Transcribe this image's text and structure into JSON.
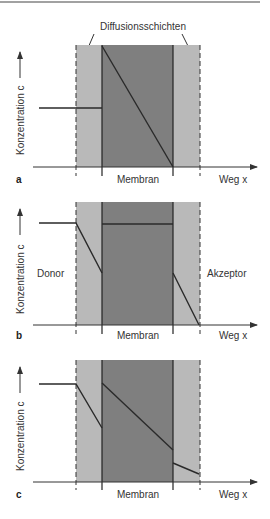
{
  "figure": {
    "top_label": "Diffusionsschichten",
    "colors": {
      "diffusion_layer": "#b9b9b9",
      "membrane": "#7f7f7f",
      "line": "#2a2a2a",
      "text": "#333333"
    },
    "panels": [
      {
        "letter": "a",
        "y_label": "Konzentration c",
        "x_label": "Weg x",
        "membrane_label": "Membran",
        "donor_label": "",
        "acceptor_label": ""
      },
      {
        "letter": "b",
        "y_label": "Konzentration c",
        "x_label": "Weg x",
        "membrane_label": "Membran",
        "donor_label": "Donor",
        "acceptor_label": "Akzeptor"
      },
      {
        "letter": "c",
        "y_label": "Konzentration c",
        "x_label": "Weg x",
        "membrane_label": "Membran",
        "donor_label": "",
        "acceptor_label": ""
      }
    ]
  }
}
